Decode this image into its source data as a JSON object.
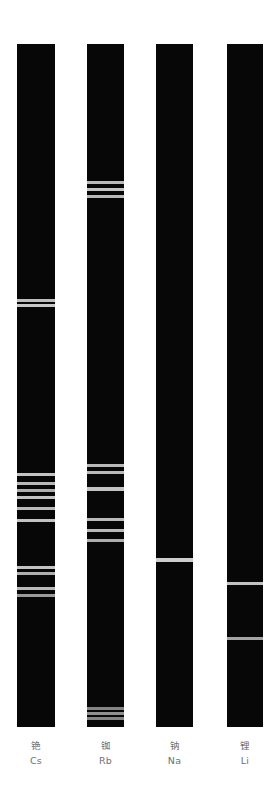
{
  "figure": {
    "background_color": "#ffffff",
    "spectrum_background_color": "#070707",
    "line_color": "#d8d8d8",
    "label_color": "#6f6f6f"
  },
  "chart_data": {
    "type": "heatmap",
    "xlabel": "",
    "ylabel": "",
    "grid": false,
    "legend_position": "none",
    "axis_note": "Each column is a vertical emission spectrum strip; bright horizontal lines are emission lines. Positions given in pixels from the top of each strip (strip spans y=44 to y=727).",
    "ylim": [
      44,
      727
    ],
    "categories": [
      "铯",
      "铷",
      "钠",
      "锂"
    ],
    "series": [
      {
        "name": "Cs",
        "name_cn": "铯",
        "label_cn": "铯",
        "symbol": "Cs",
        "column_x": 17,
        "column_width": 38,
        "lines": [
          {
            "y": 300,
            "thickness": 3,
            "intensity": 0.88
          },
          {
            "y": 305,
            "thickness": 3,
            "intensity": 0.92
          },
          {
            "y": 474,
            "thickness": 3,
            "intensity": 0.9
          },
          {
            "y": 483,
            "thickness": 3,
            "intensity": 0.85
          },
          {
            "y": 490,
            "thickness": 3,
            "intensity": 0.8
          },
          {
            "y": 497,
            "thickness": 3,
            "intensity": 0.9
          },
          {
            "y": 508,
            "thickness": 3,
            "intensity": 0.85
          },
          {
            "y": 520,
            "thickness": 3,
            "intensity": 0.9
          },
          {
            "y": 567,
            "thickness": 3,
            "intensity": 0.9
          },
          {
            "y": 573,
            "thickness": 3,
            "intensity": 0.8
          },
          {
            "y": 588,
            "thickness": 3,
            "intensity": 0.85
          },
          {
            "y": 595,
            "thickness": 3,
            "intensity": 0.7
          }
        ]
      },
      {
        "name": "Rb",
        "name_cn": "铷",
        "label_cn": "铷",
        "symbol": "Rb",
        "column_x": 87,
        "column_width": 37,
        "lines": [
          {
            "y": 182,
            "thickness": 3,
            "intensity": 0.85
          },
          {
            "y": 189,
            "thickness": 3,
            "intensity": 0.9
          },
          {
            "y": 196,
            "thickness": 3,
            "intensity": 0.85
          },
          {
            "y": 465,
            "thickness": 3,
            "intensity": 0.85
          },
          {
            "y": 472,
            "thickness": 3,
            "intensity": 0.85
          },
          {
            "y": 489,
            "thickness": 4,
            "intensity": 0.9
          },
          {
            "y": 519,
            "thickness": 3,
            "intensity": 0.85
          },
          {
            "y": 530,
            "thickness": 3,
            "intensity": 0.85
          },
          {
            "y": 540,
            "thickness": 3,
            "intensity": 0.8
          },
          {
            "y": 708,
            "thickness": 3,
            "intensity": 0.6
          },
          {
            "y": 713,
            "thickness": 3,
            "intensity": 0.65
          },
          {
            "y": 718,
            "thickness": 3,
            "intensity": 0.6
          }
        ]
      },
      {
        "name": "Na",
        "name_cn": "钠",
        "label_cn": "钠",
        "symbol": "Na",
        "column_x": 156,
        "column_width": 37,
        "lines": [
          {
            "y": 560,
            "thickness": 4,
            "intensity": 0.95
          }
        ]
      },
      {
        "name": "Li",
        "name_cn": "锂",
        "label_cn": "锂",
        "symbol": "Li",
        "column_x": 227,
        "column_width": 36,
        "lines": [
          {
            "y": 583,
            "thickness": 3,
            "intensity": 0.9
          },
          {
            "y": 638,
            "thickness": 3,
            "intensity": 0.75
          }
        ]
      }
    ]
  },
  "labels": [
    {
      "cn": "铯",
      "symbol": "Cs"
    },
    {
      "cn": "铷",
      "symbol": "Rb"
    },
    {
      "cn": "钠",
      "symbol": "Na"
    },
    {
      "cn": "锂",
      "symbol": "Li"
    }
  ]
}
